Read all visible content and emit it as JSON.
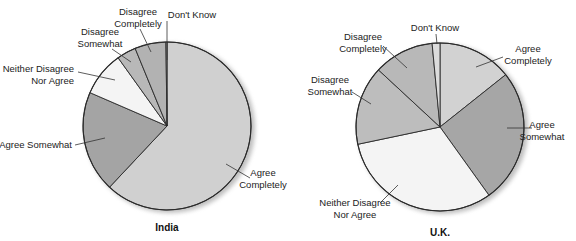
{
  "chart_data": [
    {
      "type": "pie",
      "title": "India",
      "start_angle_deg": 0,
      "direction": "clockwise",
      "center": [
        167,
        126
      ],
      "radius": 84,
      "categories": [
        "Agree Completely",
        "Agree Somewhat",
        "Neither Disagree Nor Agree",
        "Disagree Somewhat",
        "Disagree Completely",
        "Don't Know"
      ],
      "values": [
        62,
        19.5,
        8.6,
        3.7,
        6,
        0.2
      ],
      "colors": [
        "#d0d0d0",
        "#a4a4a4",
        "#f4f4f4",
        "#b8b8b8",
        "#b2b2b2",
        "#e0e0e0"
      ],
      "labels": [
        {
          "lines": [
            "Agree",
            "Completely"
          ],
          "x": 263,
          "y": 176,
          "anchor": "middle",
          "leader": [
            [
              226,
              164
            ],
            [
              250,
              178
            ]
          ]
        },
        {
          "lines": [
            "Agree Somewhat"
          ],
          "x": 72,
          "y": 148,
          "anchor": "end",
          "leader": [
            [
              75,
              145
            ],
            [
              105,
              138
            ]
          ]
        },
        {
          "lines": [
            "Neither Disagree",
            "Nor Agree"
          ],
          "x": 74,
          "y": 72,
          "anchor": "end",
          "leader": [
            [
              78,
              72
            ],
            [
              115,
              80
            ]
          ]
        },
        {
          "lines": [
            "Disagree",
            "Somewhat"
          ],
          "x": 100,
          "y": 35,
          "anchor": "middle",
          "leader": [
            [
              112,
              49
            ],
            [
              131,
              62
            ]
          ]
        },
        {
          "lines": [
            "Disagree",
            "Completely"
          ],
          "x": 138,
          "y": 15,
          "anchor": "middle",
          "leader": [
            [
              140,
              29
            ],
            [
              151,
              52
            ]
          ]
        },
        {
          "lines": [
            "Don't Know"
          ],
          "x": 192,
          "y": 18,
          "anchor": "middle",
          "leader": [
            [
              167,
              21
            ],
            [
              167,
              60
            ]
          ]
        }
      ]
    },
    {
      "type": "pie",
      "title": "U.K.",
      "start_angle_deg": 0,
      "direction": "clockwise",
      "center": [
        440,
        127
      ],
      "radius": 84,
      "categories": [
        "Agree Completely",
        "Agree Somewhat",
        "Neither Disagree Nor Agree",
        "Disagree Somewhat",
        "Disagree Completely",
        "Don't Know"
      ],
      "values": [
        14.3,
        25.8,
        31.6,
        15.2,
        11.6,
        1.5
      ],
      "colors": [
        "#d2d2d2",
        "#a6a6a6",
        "#f4f4f4",
        "#bdbdbd",
        "#b8b8b8",
        "#dcdcdc"
      ],
      "labels": [
        {
          "lines": [
            "Agree",
            "Completely"
          ],
          "x": 528,
          "y": 52,
          "anchor": "middle",
          "leader": [
            [
              476,
              67
            ],
            [
              503,
              57
            ]
          ]
        },
        {
          "lines": [
            "Agree",
            "Somewhat"
          ],
          "x": 542,
          "y": 128,
          "anchor": "middle",
          "leader": [
            [
              507,
              128
            ],
            [
              532,
              128
            ]
          ]
        },
        {
          "lines": [
            "Neither Disagree",
            "Nor Agree"
          ],
          "x": 355,
          "y": 206,
          "anchor": "middle",
          "leader": [
            [
              398,
              185
            ],
            [
              380,
              203
            ]
          ]
        },
        {
          "lines": [
            "Disagree",
            "Somewhat"
          ],
          "x": 330,
          "y": 83,
          "anchor": "middle",
          "leader": [
            [
              352,
              92
            ],
            [
              371,
              104
            ]
          ]
        },
        {
          "lines": [
            "Disagree",
            "Completely"
          ],
          "x": 363,
          "y": 40,
          "anchor": "middle",
          "leader": [
            [
              383,
              46
            ],
            [
              407,
              68
            ]
          ]
        },
        {
          "lines": [
            "Don't Know"
          ],
          "x": 435,
          "y": 31,
          "anchor": "middle",
          "leader": [
            [
              436,
              34
            ],
            [
              437,
              44
            ]
          ]
        }
      ]
    }
  ],
  "charts": {
    "india": {
      "title": "India"
    },
    "uk": {
      "title": "U.K."
    }
  }
}
